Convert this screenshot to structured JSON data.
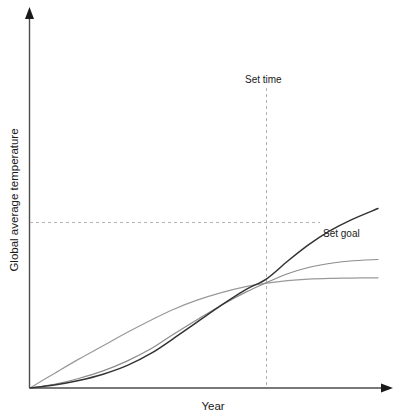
{
  "chart_data": {
    "type": "line",
    "title": "",
    "subtitle": "",
    "xlabel": "Year",
    "ylabel": "Global average temperature",
    "xlim": [
      0,
      1
    ],
    "ylim": [
      0,
      1
    ],
    "grid": false,
    "legend_position": "none",
    "axis_ticks": {
      "x_tick_labels": [],
      "y_tick_labels": []
    },
    "annotations": [
      {
        "name": "set-time",
        "label": "Set time",
        "kind": "vertical-dashed-line",
        "x": 0.68,
        "label_x_px": 245,
        "label_y_px": 82
      },
      {
        "name": "set-goal",
        "label": "Set goal",
        "kind": "horizontal-dashed-line",
        "y": 0.455,
        "label_x_px": 322,
        "label_y_px": 236
      }
    ],
    "intersection_point": {
      "x": 0.68,
      "y": 0.42,
      "px": [
        266,
        232
      ]
    },
    "series": [
      {
        "name": "fast-overshoot",
        "label": "Continued warming",
        "color": "#333333",
        "width": 1.5,
        "x": [
          0.0,
          0.07,
          0.14,
          0.21,
          0.28,
          0.35,
          0.41,
          0.48,
          0.55,
          0.62,
          0.68,
          0.74,
          0.8,
          0.86,
          0.92,
          1.0
        ],
        "y": [
          0.0,
          0.012,
          0.03,
          0.055,
          0.09,
          0.14,
          0.195,
          0.262,
          0.33,
          0.392,
          0.435,
          0.505,
          0.57,
          0.625,
          0.668,
          0.715
        ]
      },
      {
        "name": "moderate-plateau",
        "label": "Delayed action",
        "color": "#8c8c8c",
        "width": 1.2,
        "x": [
          0.0,
          0.07,
          0.14,
          0.21,
          0.28,
          0.35,
          0.41,
          0.48,
          0.55,
          0.62,
          0.68,
          0.74,
          0.8,
          0.86,
          0.92,
          1.0
        ],
        "y": [
          0.0,
          0.015,
          0.038,
          0.068,
          0.108,
          0.158,
          0.212,
          0.272,
          0.33,
          0.382,
          0.42,
          0.455,
          0.48,
          0.496,
          0.506,
          0.512
        ]
      },
      {
        "name": "early-action-goal",
        "label": "Early action",
        "color": "#999999",
        "width": 1.2,
        "x": [
          0.0,
          0.07,
          0.14,
          0.21,
          0.28,
          0.35,
          0.41,
          0.48,
          0.55,
          0.62,
          0.68,
          0.74,
          0.8,
          0.86,
          0.92,
          1.0
        ],
        "y": [
          0.0,
          0.058,
          0.115,
          0.168,
          0.222,
          0.272,
          0.312,
          0.35,
          0.38,
          0.404,
          0.418,
          0.428,
          0.434,
          0.437,
          0.438,
          0.439
        ]
      }
    ]
  },
  "axes": {
    "x_axis_label": "Year",
    "y_axis_label": "Global average temperature"
  },
  "annotations": {
    "set_time_label": "Set time",
    "set_goal_label": "Set goal"
  },
  "colors": {
    "background": "#ffffff",
    "axis": "#4d4d4d",
    "guide": "#b3b3b3",
    "series_dark": "#333333",
    "series_mid": "#8c8c8c",
    "series_light": "#999999",
    "text": "#1a1a1a"
  }
}
